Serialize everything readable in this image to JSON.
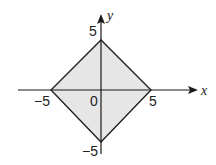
{
  "diagram": {
    "type": "coordinate-plane-region",
    "axes": {
      "x_label": "x",
      "y_label": "y",
      "origin_label": "0"
    },
    "tick_labels": {
      "x_neg": "−5",
      "x_pos": "5",
      "y_pos": "5",
      "y_neg": "−5"
    },
    "vertices": [
      [
        5,
        0
      ],
      [
        0,
        5
      ],
      [
        -5,
        0
      ],
      [
        0,
        -5
      ]
    ],
    "colors": {
      "fill": "#e6e6e6",
      "stroke": "#1a1a1a",
      "background": "#ffffff"
    }
  }
}
